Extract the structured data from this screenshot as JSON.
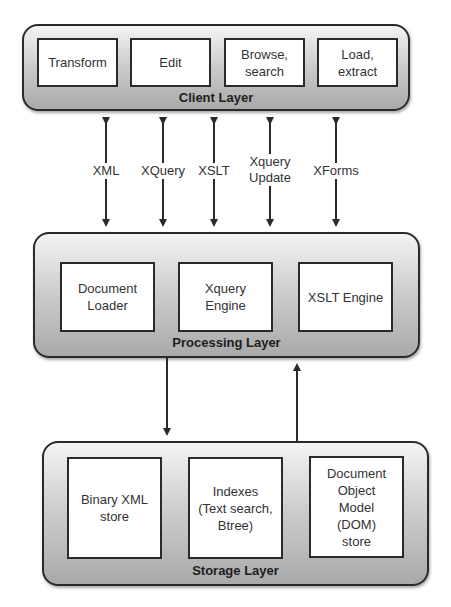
{
  "diagram": {
    "layers": {
      "client": {
        "title": "Client Layer",
        "components": [
          "Transform",
          "Edit",
          "Browse,\nsearch",
          "Load,\nextract"
        ]
      },
      "processing": {
        "title": "Processing Layer",
        "components": [
          "Document\nLoader",
          "Xquery\nEngine",
          "XSLT Engine"
        ]
      },
      "storage": {
        "title": "Storage Layer",
        "components": [
          "Binary XML\nstore",
          "Indexes\n(Text search,\nBtree)",
          "Document\nObject\nModel\n(DOM)\nstore"
        ]
      }
    },
    "client_processing_connections": [
      {
        "label": "XML",
        "direction": "bidirectional"
      },
      {
        "label": "XQuery",
        "direction": "bidirectional"
      },
      {
        "label": "XSLT",
        "direction": "bidirectional"
      },
      {
        "label": "Xquery\nUpdate",
        "direction": "bidirectional"
      },
      {
        "label": "XForms",
        "direction": "bidirectional"
      }
    ],
    "processing_storage_connections": [
      {
        "from": "Processing Layer",
        "to": "Storage Layer",
        "direction": "down"
      },
      {
        "from": "Storage Layer",
        "to": "Processing Layer",
        "direction": "up"
      }
    ]
  }
}
